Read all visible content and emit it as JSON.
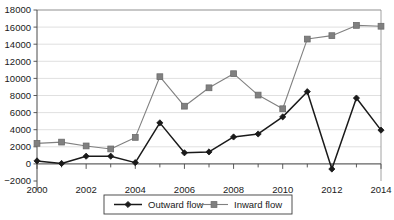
{
  "chart_data": {
    "type": "line",
    "title": "",
    "subtitle": "",
    "xlabel": "",
    "ylabel": "",
    "x": [
      2000,
      2001,
      2002,
      2003,
      2004,
      2005,
      2006,
      2007,
      2008,
      2009,
      2010,
      2011,
      2012,
      2013,
      2014
    ],
    "categories": [
      "2000",
      "2001",
      "2002",
      "2003",
      "2004",
      "2005",
      "2006",
      "2007",
      "2008",
      "2009",
      "2010",
      "2011",
      "2012",
      "2013",
      "2014"
    ],
    "series": [
      {
        "name": "Outward flow",
        "marker": "diamond",
        "color": "#1a1a1a",
        "values": [
          350,
          50,
          900,
          900,
          150,
          4800,
          1300,
          1400,
          3150,
          3500,
          5500,
          8450,
          -600,
          7700,
          3950
        ]
      },
      {
        "name": "Inward flow",
        "marker": "square",
        "color": "#808080",
        "values": [
          2400,
          2550,
          2100,
          1750,
          3100,
          10200,
          6750,
          8900,
          10550,
          8050,
          6450,
          14600,
          15000,
          16200,
          16100
        ]
      }
    ],
    "xlim": [
      2000,
      2014
    ],
    "ylim": [
      -2000,
      18000
    ],
    "ytick_step": 2000,
    "yticks": [
      -2000,
      0,
      2000,
      4000,
      6000,
      8000,
      10000,
      12000,
      14000,
      16000,
      18000
    ],
    "ytick_labels": [
      "−2000",
      "0",
      "2000",
      "4000",
      "6000",
      "8000",
      "10000",
      "12000",
      "14000",
      "16000",
      "18000"
    ],
    "xticks_labeled": [
      2000,
      2002,
      2004,
      2006,
      2008,
      2010,
      2012,
      2014
    ],
    "xtick_labels": [
      "2000",
      "2002",
      "2004",
      "2006",
      "2008",
      "2010",
      "2012",
      "2014"
    ],
    "xticks_minor": [
      2001,
      2003,
      2005,
      2007,
      2009,
      2011,
      2013
    ],
    "grid": true,
    "grid_axis": "y",
    "legend_position": "bottom-center",
    "legend_entries": [
      "Outward flow",
      "Inward flow"
    ]
  },
  "colors": {
    "outward": "#1a1a1a",
    "inward": "#808080",
    "grid": "#d2d2d2",
    "axis": "#4a4a4a",
    "frame": "#8c8c8c",
    "background": "#ffffff"
  }
}
